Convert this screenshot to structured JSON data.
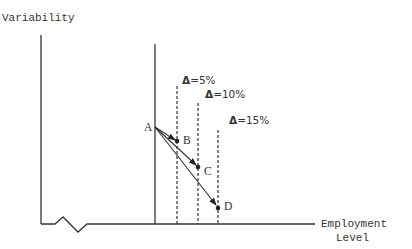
{
  "diagram": {
    "y_axis_label": "Variability",
    "x_axis_label_line1": "Employment",
    "x_axis_label_line2": "Level",
    "thresholds": [
      {
        "symbol": "Δ",
        "text": "=5%",
        "x": 177
      },
      {
        "symbol": "Δ",
        "text": "=10%",
        "x": 198
      },
      {
        "symbol": "Δ",
        "text": "=15%",
        "x": 218
      }
    ],
    "points": [
      {
        "label": "A"
      },
      {
        "label": "B"
      },
      {
        "label": "C"
      },
      {
        "label": "D"
      }
    ],
    "arrows": [
      {
        "from": "A",
        "to": "B"
      },
      {
        "from": "A",
        "to": "C"
      },
      {
        "from": "A",
        "to": "D"
      }
    ],
    "axis_break": "zigzag"
  }
}
